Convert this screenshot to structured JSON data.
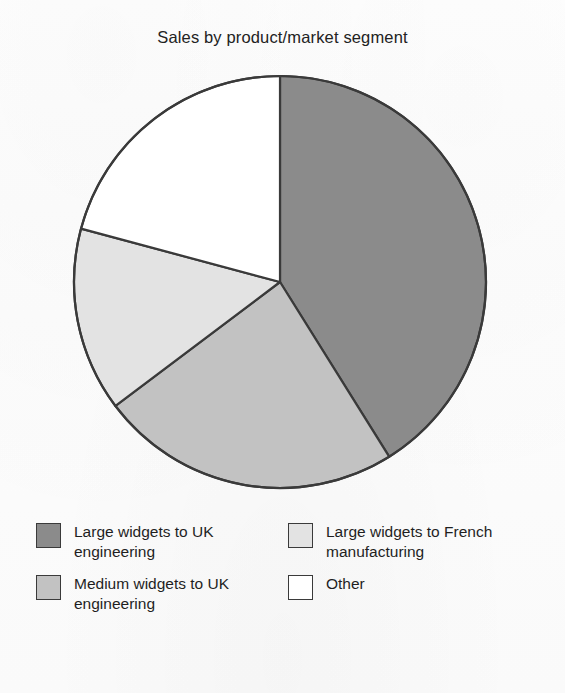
{
  "chart_data": {
    "type": "pie",
    "title": "Sales by product/market segment",
    "xlabel": "",
    "ylabel": "",
    "legend_position": "bottom",
    "grid": false,
    "start_angle_deg": 0,
    "direction": "clockwise",
    "categories": [
      "Large widgets to UK engineering",
      "Medium widgets to UK engineering",
      "Large widgets to French manufacturing",
      "Other"
    ],
    "values": [
      41,
      24,
      14,
      21
    ],
    "units": "percent",
    "slices": [
      {
        "label": "Large widgets to UK engineering",
        "value": 41,
        "color": "#8b8b8b",
        "start_deg": 0,
        "end_deg": 148
      },
      {
        "label": "Medium widgets to UK engineering",
        "value": 24,
        "color": "#c2c2c2",
        "start_deg": 148,
        "end_deg": 233
      },
      {
        "label": "Large widgets to French manufacturing",
        "value": 14,
        "color": "#e3e3e3",
        "start_deg": 233,
        "end_deg": 285
      },
      {
        "label": "Other",
        "value": 21,
        "color": "#ffffff",
        "start_deg": 285,
        "end_deg": 360
      }
    ]
  },
  "title": {
    "text": "Sales by product/market segment"
  },
  "legend": {
    "items": [
      {
        "label": "Large widgets to UK engineering",
        "color": "#8b8b8b"
      },
      {
        "label": "Large widgets to French manufacturing",
        "color": "#e3e3e3"
      },
      {
        "label": "Medium widgets to UK engineering",
        "color": "#c2c2c2"
      },
      {
        "label": "Other",
        "color": "#ffffff"
      }
    ]
  },
  "style": {
    "outline_color": "#3a3a3a",
    "background": "#fdfdfd",
    "text_color": "#1f1f1f"
  }
}
